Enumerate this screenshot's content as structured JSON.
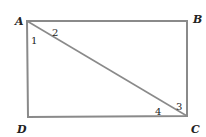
{
  "diagram": {
    "type": "rectangle-with-diagonal",
    "stroke_color": "#8a8a8a",
    "vertices": [
      {
        "label": "A",
        "x": 27,
        "y": 21
      },
      {
        "label": "B",
        "x": 187,
        "y": 21
      },
      {
        "label": "C",
        "x": 187,
        "y": 116
      },
      {
        "label": "D",
        "x": 28,
        "y": 117
      }
    ],
    "diagonal": {
      "from": "A",
      "to": "C"
    },
    "angles": [
      {
        "label": "1",
        "at": "A"
      },
      {
        "label": "2",
        "at": "A"
      },
      {
        "label": "3",
        "at": "C"
      },
      {
        "label": "4",
        "at": "C"
      }
    ]
  }
}
